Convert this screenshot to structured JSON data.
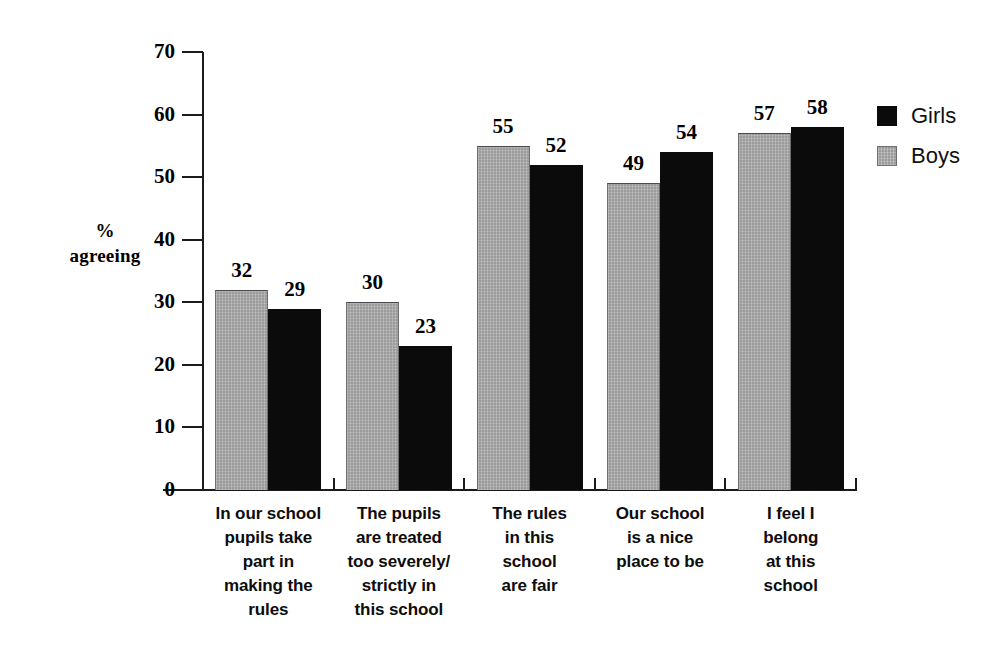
{
  "chart_data": {
    "type": "bar",
    "title": "",
    "xlabel": "",
    "ylabel": "%\nagreeing",
    "ylabel_lines": [
      "%",
      "agreeing"
    ],
    "ylim": [
      0,
      70
    ],
    "ytick_step": 10,
    "yticks": [
      "70",
      "60",
      "50",
      "40",
      "30",
      "20",
      "10",
      "0"
    ],
    "ytick_values": [
      70,
      60,
      50,
      40,
      30,
      20,
      10,
      0
    ],
    "grid": false,
    "legend_position": "right-top",
    "categories": [
      "In our school pupils take part in making the rules",
      "The pupils are treated too severely/ strictly in this school",
      "The rules in this school are fair",
      "Our school is a nice place to be",
      "I feel I belong at this school"
    ],
    "category_lines": [
      [
        "In our school",
        "pupils take",
        "part in",
        "making the",
        "rules"
      ],
      [
        "The pupils",
        "are treated",
        "too severely/",
        "strictly in",
        "this school"
      ],
      [
        "The rules",
        "in this",
        "school",
        "are fair"
      ],
      [
        "Our school",
        "is a nice",
        "place to be"
      ],
      [
        "I feel I",
        "belong",
        "at this",
        "school"
      ]
    ],
    "series": [
      {
        "name": "Boys",
        "color": "#9b9b9b",
        "values": [
          32,
          30,
          55,
          49,
          57
        ]
      },
      {
        "name": "Girls",
        "color": "#0b0b0b",
        "values": [
          29,
          23,
          52,
          54,
          58
        ]
      }
    ],
    "legend": [
      {
        "label": "Girls",
        "color": "#0b0b0b",
        "swatch": "black"
      },
      {
        "label": "Boys",
        "color": "#9b9b9b",
        "swatch": "gray"
      }
    ]
  }
}
